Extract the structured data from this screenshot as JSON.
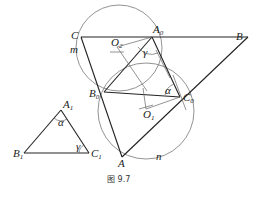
{
  "figure": {
    "caption": "图 9.7",
    "points": {
      "C": {
        "label": "C",
        "x": 81,
        "y": 37
      },
      "A0": {
        "label": "A",
        "sub": "0",
        "x": 152,
        "y": 37
      },
      "B": {
        "label": "B",
        "x": 248,
        "y": 37
      },
      "B0": {
        "label": "B",
        "sub": "0",
        "x": 104,
        "y": 92
      },
      "C0": {
        "label": "C",
        "sub": "0",
        "x": 180,
        "y": 97
      },
      "A": {
        "label": "A",
        "x": 122,
        "y": 157
      },
      "O2": {
        "label": "O",
        "sub": "2",
        "x": 117,
        "y": 47
      },
      "O1": {
        "label": "O",
        "sub": "1",
        "x": 146,
        "y": 109
      },
      "A1": {
        "label": "A",
        "sub": "1",
        "x": 61,
        "y": 110
      },
      "B1": {
        "label": "B",
        "sub": "1",
        "x": 24,
        "y": 153
      },
      "C1": {
        "label": "C",
        "sub": "1",
        "x": 89,
        "y": 153
      }
    },
    "arc_labels": {
      "m": "m",
      "n": "n"
    },
    "angle_labels": {
      "alpha": "α",
      "gamma": "γ"
    }
  }
}
